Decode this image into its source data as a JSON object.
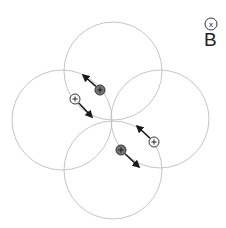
{
  "field": {
    "symbol": "x",
    "label": "B",
    "direction": "into-page"
  },
  "colors": {
    "circle_stroke": "#bdbdbd",
    "arrow": "#1a1a1a",
    "positive_fill": "#777777",
    "open_fill": "#ffffff",
    "marker_stroke": "#222222"
  },
  "circles": [
    {
      "name": "top",
      "cx": 113,
      "cy": 71,
      "r": 49
    },
    {
      "name": "left",
      "cx": 62,
      "cy": 120,
      "r": 50
    },
    {
      "name": "right",
      "cx": 160,
      "cy": 119,
      "r": 49
    },
    {
      "name": "bottom",
      "cx": 113,
      "cy": 170,
      "r": 49
    }
  ],
  "particles": [
    {
      "name": "filled-top",
      "type": "filled",
      "sign": "+",
      "x": 100,
      "y": 90,
      "arrow_to": [
        83,
        75
      ]
    },
    {
      "name": "open-left",
      "type": "open",
      "sign": "+",
      "x": 75,
      "y": 99,
      "arrow_to": [
        92,
        117
      ]
    },
    {
      "name": "open-right",
      "type": "open",
      "sign": "+",
      "x": 154,
      "y": 142,
      "arrow_to": [
        137,
        126
      ]
    },
    {
      "name": "filled-bottom",
      "type": "filled",
      "sign": "+",
      "x": 121,
      "y": 150,
      "arrow_to": [
        139,
        167
      ]
    }
  ]
}
